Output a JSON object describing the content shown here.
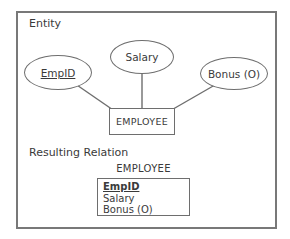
{
  "diagram": {
    "entity_section_label": "Entity",
    "entity": {
      "name": "EMPLOYEE"
    },
    "attributes": [
      {
        "label": "EmpID",
        "is_key": true
      },
      {
        "label": "Salary",
        "is_key": false
      },
      {
        "label": "Bonus (O)",
        "is_key": false
      }
    ],
    "relation_section_label": "Resulting Relation",
    "relation": {
      "title": "EMPLOYEE",
      "rows": [
        {
          "label": "EmpID",
          "is_primary_key": true
        },
        {
          "label": "Salary",
          "is_primary_key": false
        },
        {
          "label": "Bonus (O)",
          "is_primary_key": false
        }
      ]
    },
    "colors": {
      "line": "#6e6e6e",
      "frame": "#787878",
      "text": "#3a3a3a",
      "background": "#ffffff"
    }
  }
}
